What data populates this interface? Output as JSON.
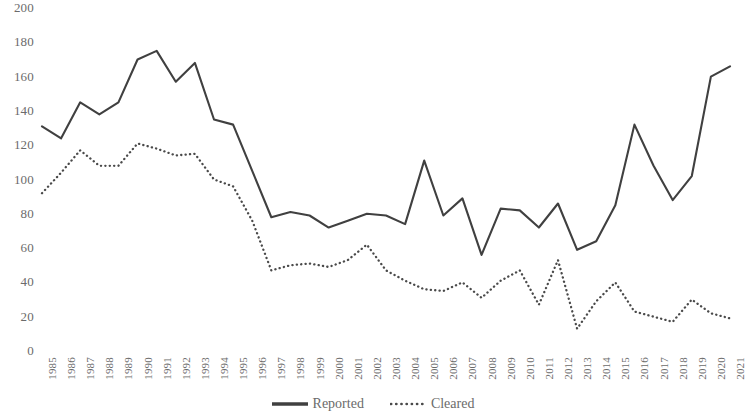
{
  "chart_data": {
    "type": "line",
    "title": "",
    "subtitle": "",
    "xlabel": "",
    "ylabel": "",
    "grid": false,
    "legend_position": "bottom-center",
    "ylim": [
      0,
      200
    ],
    "y_ticks": [
      0,
      20,
      40,
      60,
      80,
      100,
      120,
      140,
      160,
      180,
      200
    ],
    "y_tick_labels": [
      "0",
      "20",
      "40",
      "60",
      "80",
      "100",
      "120",
      "140",
      "160",
      "180",
      "200"
    ],
    "x": [
      "1985",
      "1986",
      "1987",
      "1988",
      "1989",
      "1990",
      "1991",
      "1992",
      "1993",
      "1994",
      "1995",
      "1996",
      "1997",
      "1998",
      "1999",
      "2000",
      "2001",
      "2002",
      "2003",
      "2004",
      "2005",
      "2006",
      "2007",
      "2008",
      "2009",
      "2010",
      "2011",
      "2012",
      "2013",
      "2014",
      "2015",
      "2016",
      "2017",
      "2018",
      "2019",
      "2020",
      "2021"
    ],
    "categories": [
      "1985",
      "1986",
      "1987",
      "1988",
      "1989",
      "1990",
      "1991",
      "1992",
      "1993",
      "1994",
      "1995",
      "1996",
      "1997",
      "1998",
      "1999",
      "2000",
      "2001",
      "2002",
      "2003",
      "2004",
      "2005",
      "2006",
      "2007",
      "2008",
      "2009",
      "2010",
      "2011",
      "2012",
      "2013",
      "2014",
      "2015",
      "2016",
      "2017",
      "2018",
      "2019",
      "2020",
      "2021"
    ],
    "series": [
      {
        "name": "Reported",
        "style": "solid",
        "color": "#404040",
        "values": [
          131,
          124,
          145,
          138,
          145,
          170,
          175,
          157,
          168,
          135,
          132,
          105,
          78,
          81,
          79,
          72,
          76,
          80,
          79,
          74,
          111,
          79,
          89,
          56,
          83,
          82,
          72,
          86,
          59,
          64,
          85,
          132,
          108,
          88,
          102,
          160,
          166
        ]
      },
      {
        "name": "Cleared",
        "style": "dotted",
        "color": "#4a4a4a",
        "values": [
          92,
          104,
          117,
          108,
          108,
          121,
          118,
          114,
          115,
          100,
          96,
          76,
          47,
          50,
          51,
          49,
          53,
          62,
          47,
          41,
          36,
          35,
          40,
          31,
          41,
          47,
          27,
          53,
          13,
          29,
          40,
          23,
          20,
          17,
          30,
          22,
          19
        ]
      }
    ]
  },
  "legend": {
    "items": [
      {
        "label": "Reported",
        "icon": "solid-line-swatch"
      },
      {
        "label": "Cleared",
        "icon": "dotted-line-swatch"
      }
    ]
  },
  "colors": {
    "reported": "#404040",
    "cleared": "#4a4a4a",
    "axis_text": "#6b6b6b",
    "background": "#ffffff"
  }
}
